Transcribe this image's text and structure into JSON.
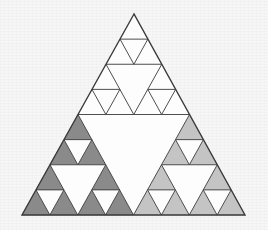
{
  "figure": {
    "name": "sierpinski-triangle",
    "title": "Sierpinski Triangle",
    "recursion_levels": 3,
    "canvas": {
      "width": 268,
      "height": 230
    }
  },
  "colors": {
    "background": "#f6f6f6",
    "outline": "#3a3a3a",
    "left_fill": "#8a8a8a",
    "right_fill": "#c4c4c4",
    "apex_fill": "#fdfdfd",
    "hole_fill": "#fdfdfd"
  },
  "geometry": {
    "outer_triangle": {
      "apex": {
        "x": 134,
        "y": 14
      },
      "left_base": {
        "x": 22,
        "y": 215
      },
      "right_base": {
        "x": 245,
        "y": 215
      }
    },
    "outline_width": 1.4,
    "holes": [
      {
        "level": 1,
        "top_left": {
          "x": 78,
          "y": 114.5
        },
        "top_right": {
          "x": 189,
          "y": 114.5
        },
        "bottom": {
          "x": 133.5,
          "y": 215
        }
      },
      {
        "level": 2,
        "top_left": {
          "x": 106,
          "y": 64.2
        },
        "top_right": {
          "x": 161.5,
          "y": 64.2
        },
        "bottom": {
          "x": 133.75,
          "y": 114.5
        }
      },
      {
        "level": 3,
        "top_left": {
          "x": 120,
          "y": 39.1
        },
        "top_right": {
          "x": 147.75,
          "y": 39.1
        },
        "bottom": {
          "x": 133.9,
          "y": 64.2
        }
      },
      {
        "level": 4,
        "top_left": {
          "x": 127,
          "y": 26.5
        },
        "top_right": {
          "x": 140.9,
          "y": 26.5
        },
        "bottom": {
          "x": 133.9,
          "y": 39.1
        }
      }
    ]
  },
  "legend": {
    "left_branch_label": "left sub-triangle",
    "right_branch_label": "right sub-triangle",
    "apex_branch_label": "apex sub-triangle",
    "hole_label": "removed central triangle"
  }
}
